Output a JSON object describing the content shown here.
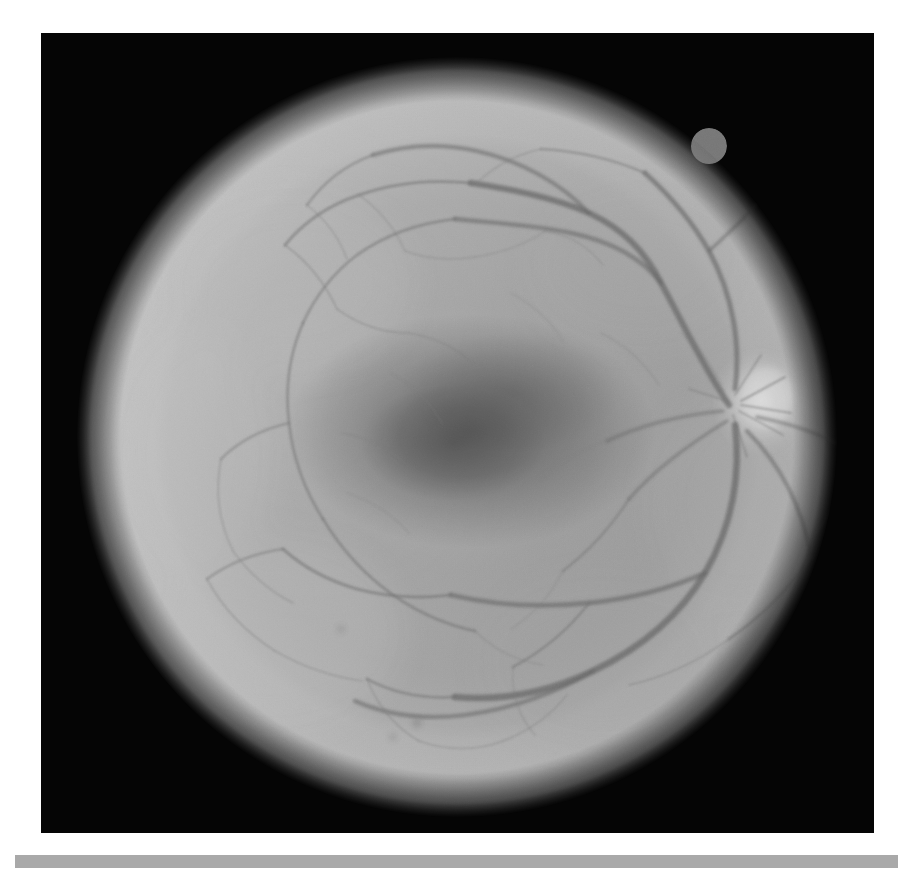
{
  "document": {
    "kind": "retinal-fundus-photograph",
    "page_background": "#ffffff",
    "caption": "",
    "width_px": 920,
    "height_px": 873
  },
  "figure": {
    "name": "fundus-photograph",
    "panel": {
      "x": 41,
      "y": 33,
      "width": 833,
      "height": 800,
      "background_color": "#050505"
    },
    "modality": "grayscale",
    "palette": {
      "background": "#050505",
      "retina_mid": "#8f8f8f",
      "retina_bright_rim": "#b4b4b4",
      "retina_edge_falloff": "#4a4a4a",
      "macula_dark": "#4e4e4e",
      "optic_disc": "#cfcfcf",
      "vessel_dark": "#5a5a5a",
      "rule_gray": "#a9a9a9"
    },
    "anatomy": [
      {
        "id": "fundus-disc",
        "label": "Retinal field",
        "shape": "circle",
        "cx": 416,
        "cy": 404,
        "r": 380
      },
      {
        "id": "optic-disc",
        "label": "Optic disc",
        "shape": "ellipse",
        "cx": 722,
        "cy": 368,
        "rx": 38,
        "ry": 44
      },
      {
        "id": "macula",
        "label": "Macula / fovea",
        "shape": "ellipse",
        "cx": 430,
        "cy": 400,
        "rx": 150,
        "ry": 96
      },
      {
        "id": "edge-notch",
        "label": "Edge artifact notch",
        "shape": "circle",
        "cx": 670,
        "cy": 112,
        "r": 17
      }
    ]
  },
  "bottom_rule": {
    "name": "horizontal-rule",
    "x": 15,
    "y": 855,
    "width": 883,
    "height": 13,
    "color": "#a9a9a9"
  }
}
